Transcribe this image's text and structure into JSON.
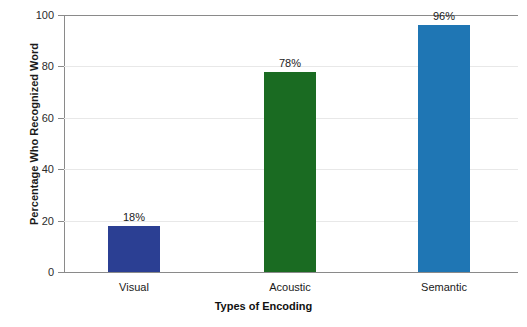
{
  "chart_data": {
    "type": "bar",
    "title": "",
    "xlabel": "Types of Encoding",
    "ylabel": "Percentage Who Recognized Word",
    "categories": [
      "Visual",
      "Acoustic",
      "Semantic"
    ],
    "values": [
      18,
      78,
      96
    ],
    "value_labels": [
      "18%",
      "78%",
      "96%"
    ],
    "colors": [
      "#2b3f93",
      "#1a6b22",
      "#1f76b4"
    ],
    "ylim": [
      0,
      100
    ],
    "yticks": [
      0,
      20,
      40,
      60,
      80,
      100
    ],
    "ytick_labels": [
      "0",
      "20",
      "40",
      "60",
      "80",
      "100"
    ],
    "grid": true,
    "legend": false
  }
}
